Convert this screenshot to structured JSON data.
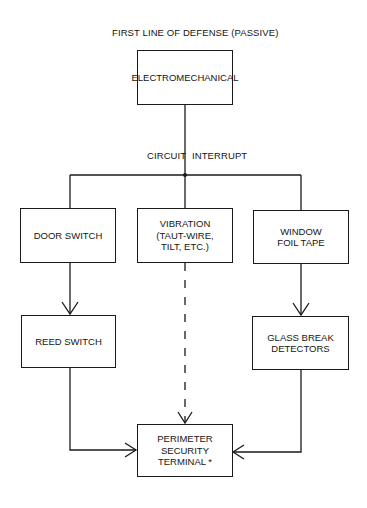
{
  "title": "FIRST LINE OF DEFENSE (PASSIVE)",
  "top_node": {
    "label": "ELECTROMECHANICAL"
  },
  "junction_label": {
    "left": "CIRCUIT",
    "right": "INTERRUPT"
  },
  "branches": [
    {
      "label_lines": [
        "DOOR SWITCH"
      ],
      "child": {
        "label_lines": [
          "REED SWITCH"
        ]
      },
      "connector": "solid"
    },
    {
      "label_lines": [
        "VIBRATION",
        "(TAUT-WIRE,",
        "TILT, ETC.)"
      ],
      "child": null,
      "connector": "dashed"
    },
    {
      "label_lines": [
        "WINDOW",
        "FOIL TAPE"
      ],
      "child": {
        "label_lines": [
          "GLASS BREAK",
          "DETECTORS"
        ]
      },
      "connector": "solid"
    }
  ],
  "terminal_node": {
    "label_lines": [
      "PERIMETER",
      "SECURITY",
      "TERMINAL *"
    ]
  },
  "colors": {
    "line": "#1a1a1a",
    "background": "#ffffff",
    "text": "#151515"
  }
}
